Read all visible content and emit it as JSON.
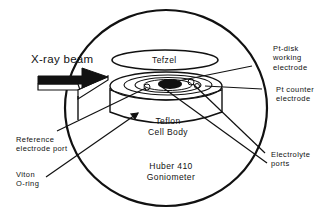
{
  "diagram": {
    "type": "schematic",
    "colors": {
      "ink": "#111111",
      "background": "#ffffff"
    },
    "labels": {
      "xray_beam": "X-ray beam",
      "tefzel": "Tefzel",
      "pt_disk_line1": "Pt-disk",
      "pt_disk_line2": "working",
      "pt_disk_line3": "electrode",
      "pt_counter_line1": "Pt  counter",
      "pt_counter_line2": "electrode",
      "reference_line1": "Reference",
      "reference_line2": "electrode  port",
      "viton_line1": "Viton",
      "viton_line2": "O-ring",
      "teflon_line1": "Teflon",
      "teflon_line2": "Cell Body",
      "huber_line1": "Huber 410",
      "huber_line2": "Goniometer",
      "electrolyte_line1": "Electrolyte",
      "electrolyte_line2": "ports"
    },
    "components": [
      {
        "name": "goniometer-circle",
        "shape": "circle"
      },
      {
        "name": "tefzel-window",
        "shape": "ellipse"
      },
      {
        "name": "teflon-cell-body",
        "shape": "cylinder"
      },
      {
        "name": "pt-disk-working-electrode",
        "shape": "filled-ellipse"
      },
      {
        "name": "xray-beam-arrow",
        "shape": "3d-arrow"
      }
    ]
  }
}
